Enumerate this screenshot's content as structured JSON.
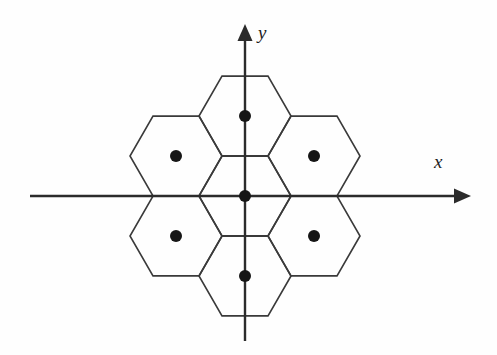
{
  "figure": {
    "background_color": "#fefefe",
    "width": 497,
    "height": 355
  },
  "axes": {
    "x": {
      "label": "x",
      "color": "#2b2b2b",
      "start_x": 30,
      "end_x": 471,
      "y": 196,
      "arrow": "right-arrowhead-icon"
    },
    "y": {
      "label": "y",
      "color": "#2b2b2b",
      "x": 245,
      "start_y": 341,
      "end_y": 24,
      "arrow": "up-arrowhead-icon"
    },
    "origin": {
      "x": 245,
      "y": 196
    }
  },
  "chart_data": {
    "type": "scatter",
    "xlabel": "x",
    "ylabel": "y",
    "grid": false,
    "legend": null,
    "lattice": {
      "cell_shape": "hexagon",
      "orientation": "flat-top",
      "circumradius": 46,
      "cell_count": 7,
      "dot_radius": 6,
      "dot_color": "#161616",
      "cell_stroke_color": "#3a3a3a"
    },
    "points": [
      {
        "name": "center",
        "x": 0,
        "y": 0,
        "px": 245,
        "py": 196
      },
      {
        "name": "north",
        "x": 0,
        "y": 1,
        "px": 245,
        "py": 116
      },
      {
        "name": "south",
        "x": 0,
        "y": -1,
        "px": 245,
        "py": 276
      },
      {
        "name": "north-west",
        "x": -1,
        "y": 0.5,
        "px": 176,
        "py": 156
      },
      {
        "name": "north-east",
        "x": 1,
        "y": 0.5,
        "px": 314,
        "py": 156
      },
      {
        "name": "south-west",
        "x": -1,
        "y": -0.5,
        "px": 176,
        "py": 236
      },
      {
        "name": "south-east",
        "x": 1,
        "y": -0.5,
        "px": 314,
        "py": 236
      }
    ],
    "xlim": [
      -2.6,
      2.8
    ],
    "ylim": [
      -1.9,
      1.9
    ]
  }
}
